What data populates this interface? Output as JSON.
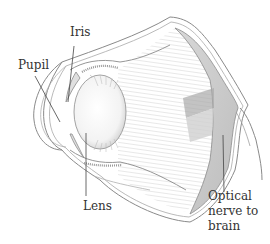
{
  "diagram": {
    "labels": {
      "iris": "Iris",
      "pupil": "Pupil",
      "lens": "Lens",
      "optic_nerve_line1": "Optical",
      "optic_nerve_line2": "nerve to",
      "optic_nerve_line3": "brain"
    },
    "colors": {
      "ink": "#333333",
      "outline": "#8a8a8a",
      "shade_dark": "#9a9a9a",
      "shade_mid": "#c8c8c8",
      "shade_light": "#e6e6e6",
      "background": "#ffffff"
    }
  }
}
